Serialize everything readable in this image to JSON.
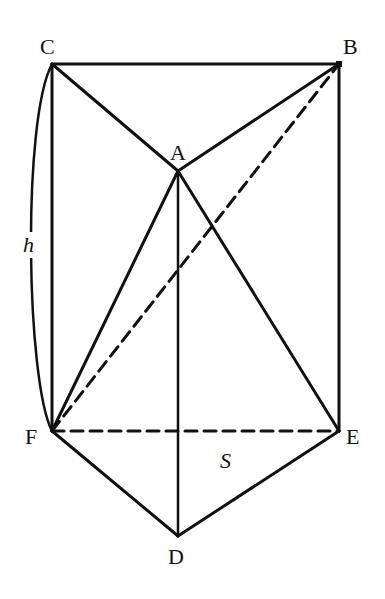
{
  "diagram": {
    "type": "triangular-prism",
    "points": {
      "C": {
        "label": "C",
        "x": 52,
        "y": 64
      },
      "B": {
        "label": "B",
        "x": 339,
        "y": 64
      },
      "A": {
        "label": "A",
        "x": 178,
        "y": 171
      },
      "F": {
        "label": "F",
        "x": 52,
        "y": 431
      },
      "E": {
        "label": "E",
        "x": 339,
        "y": 431
      },
      "D": {
        "label": "D",
        "x": 178,
        "y": 536
      }
    },
    "solid_edges": [
      "CB",
      "CA",
      "BA",
      "CF",
      "BE",
      "AD",
      "AF",
      "AE",
      "FD",
      "ED"
    ],
    "dashed_edges": [
      "FE",
      "FB"
    ],
    "annotations": {
      "height_label": "h",
      "base_area_label": "S"
    },
    "colors": {
      "stroke": "#111111",
      "background": "#ffffff"
    }
  }
}
